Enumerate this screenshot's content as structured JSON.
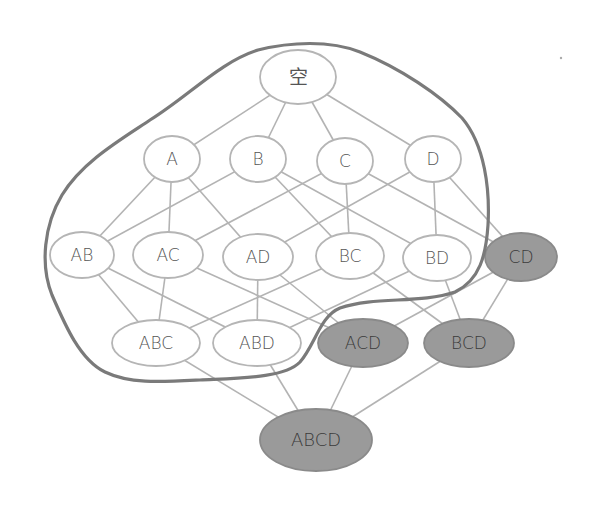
{
  "diagram": {
    "type": "hasse-lattice",
    "colors": {
      "edge": "#b3b3b3",
      "node_stroke_light": "#b5b5b5",
      "node_fill_light": "#ffffff",
      "node_fill_dark": "#9a9a9a",
      "node_stroke_dark": "#8a8a8a",
      "text": "#555555",
      "text_dark": "#3a3a3a",
      "boundary": "#7a7a7a"
    },
    "nodes": [
      {
        "id": "empty",
        "label": "空",
        "cx": 298,
        "cy": 77,
        "rx": 38,
        "ry": 27,
        "shaded": false
      },
      {
        "id": "A",
        "label": "A",
        "cx": 172,
        "cy": 159,
        "rx": 28,
        "ry": 23,
        "shaded": false
      },
      {
        "id": "B",
        "label": "B",
        "cx": 258,
        "cy": 159,
        "rx": 28,
        "ry": 23,
        "shaded": false
      },
      {
        "id": "C",
        "label": "C",
        "cx": 345,
        "cy": 161,
        "rx": 28,
        "ry": 23,
        "shaded": false
      },
      {
        "id": "D",
        "label": "D",
        "cx": 433,
        "cy": 159,
        "rx": 28,
        "ry": 23,
        "shaded": false
      },
      {
        "id": "AB",
        "label": "AB",
        "cx": 82,
        "cy": 255,
        "rx": 32,
        "ry": 23,
        "shaded": false
      },
      {
        "id": "AC",
        "label": "AC",
        "cx": 168,
        "cy": 255,
        "rx": 35,
        "ry": 23,
        "shaded": false
      },
      {
        "id": "AD",
        "label": "AD",
        "cx": 258,
        "cy": 257,
        "rx": 35,
        "ry": 23,
        "shaded": false
      },
      {
        "id": "BC",
        "label": "BC",
        "cx": 350,
        "cy": 256,
        "rx": 34,
        "ry": 23,
        "shaded": false
      },
      {
        "id": "BD",
        "label": "BD",
        "cx": 437,
        "cy": 258,
        "rx": 34,
        "ry": 23,
        "shaded": false
      },
      {
        "id": "CD",
        "label": "CD",
        "cx": 521,
        "cy": 257,
        "rx": 36,
        "ry": 24,
        "shaded": true
      },
      {
        "id": "ABC",
        "label": "ABC",
        "cx": 156,
        "cy": 343,
        "rx": 44,
        "ry": 23,
        "shaded": false
      },
      {
        "id": "ABD",
        "label": "ABD",
        "cx": 257,
        "cy": 343,
        "rx": 44,
        "ry": 23,
        "shaded": false
      },
      {
        "id": "ACD",
        "label": "ACD",
        "cx": 363,
        "cy": 343,
        "rx": 45,
        "ry": 24,
        "shaded": true
      },
      {
        "id": "BCD",
        "label": "BCD",
        "cx": 469,
        "cy": 343,
        "rx": 45,
        "ry": 24,
        "shaded": true
      },
      {
        "id": "ABCD",
        "label": "ABCD",
        "cx": 316,
        "cy": 440,
        "rx": 56,
        "ry": 31,
        "shaded": true
      }
    ],
    "edges": [
      [
        "empty",
        "A"
      ],
      [
        "empty",
        "B"
      ],
      [
        "empty",
        "C"
      ],
      [
        "empty",
        "D"
      ],
      [
        "A",
        "AB"
      ],
      [
        "A",
        "AC"
      ],
      [
        "A",
        "AD"
      ],
      [
        "B",
        "AB"
      ],
      [
        "B",
        "BC"
      ],
      [
        "B",
        "BD"
      ],
      [
        "C",
        "AC"
      ],
      [
        "C",
        "BC"
      ],
      [
        "C",
        "CD"
      ],
      [
        "D",
        "AD"
      ],
      [
        "D",
        "BD"
      ],
      [
        "D",
        "CD"
      ],
      [
        "AB",
        "ABC"
      ],
      [
        "AB",
        "ABD"
      ],
      [
        "AC",
        "ABC"
      ],
      [
        "AC",
        "ACD"
      ],
      [
        "AD",
        "ABD"
      ],
      [
        "AD",
        "ACD"
      ],
      [
        "BC",
        "ABC"
      ],
      [
        "BC",
        "BCD"
      ],
      [
        "BD",
        "ABD"
      ],
      [
        "BD",
        "BCD"
      ],
      [
        "CD",
        "ACD"
      ],
      [
        "CD",
        "BCD"
      ],
      [
        "ABC",
        "ABCD"
      ],
      [
        "ABD",
        "ABCD"
      ],
      [
        "ACD",
        "ABCD"
      ],
      [
        "BCD",
        "ABCD"
      ]
    ],
    "boundary": {
      "description": "hand-drawn closed curve enclosing empty set, singletons, AB, AC, AD, BC, BD, ABC, ABD",
      "path": "M 258 50 C 290 42, 330 40, 360 52 C 400 68, 440 95, 462 118 C 485 145, 490 190, 488 225 C 486 255, 480 280, 455 292 C 420 304, 375 296, 340 308 C 320 316, 315 345, 300 362 C 285 378, 240 378, 200 380 C 160 382, 130 384, 105 372 C 80 360, 65 325, 52 295 C 40 265, 44 225, 62 195 C 82 162, 120 140, 150 120 C 190 95, 220 62, 258 50 Z"
    }
  }
}
